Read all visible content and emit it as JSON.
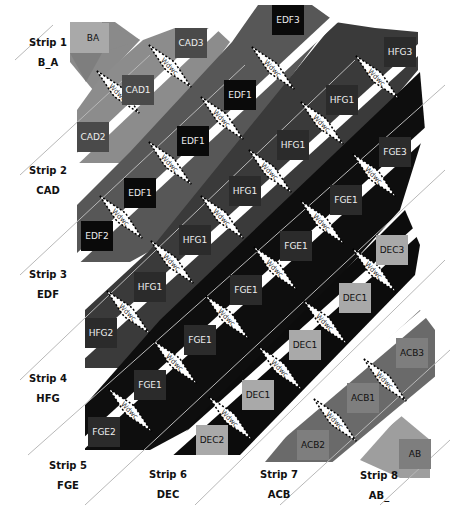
{
  "colors": {
    "background": "#ffffff",
    "light_gray": "#a9a9a9",
    "mid_gray": "#7e7e7e",
    "dark_gray": "#4a4a4a",
    "very_dark": "#2b2b2b",
    "black": "#0a0a0a",
    "separator_line": "#b8b8b8",
    "text_light": "#eeeeee",
    "text_dark": "#111111"
  },
  "strips": [
    {
      "title": "Strip 1",
      "code": "B_A",
      "x": 18,
      "y": 36
    },
    {
      "title": "Strip 2",
      "code": "CAD",
      "x": 18,
      "y": 164
    },
    {
      "title": "Strip 3",
      "code": "EDF",
      "x": 18,
      "y": 268
    },
    {
      "title": "Strip 4",
      "code": "HFG",
      "x": 18,
      "y": 372
    },
    {
      "title": "Strip 5",
      "code": "FGE",
      "x": 38,
      "y": 459
    },
    {
      "title": "Strip 6",
      "code": "DEC",
      "x": 138,
      "y": 468
    },
    {
      "title": "Strip 7",
      "code": "ACB",
      "x": 249,
      "y": 468
    },
    {
      "title": "Strip 8",
      "code": "AB_",
      "x": 349,
      "y": 469
    }
  ],
  "tiles": [
    {
      "label": "BA",
      "x": 93,
      "y": 38,
      "shade": "light",
      "text": "dark"
    },
    {
      "label": "CAD3",
      "x": 191,
      "y": 43,
      "shade": "dark",
      "text": "light"
    },
    {
      "label": "EDF3",
      "x": 288,
      "y": 20,
      "shade": "black",
      "text": "light"
    },
    {
      "label": "HFG3",
      "x": 400,
      "y": 52,
      "shade": "very_dark",
      "text": "light"
    },
    {
      "label": "CAD1",
      "x": 138,
      "y": 90,
      "shade": "dark",
      "text": "light"
    },
    {
      "label": "EDF1",
      "x": 240,
      "y": 95,
      "shade": "black",
      "text": "light"
    },
    {
      "label": "HFG1",
      "x": 342,
      "y": 100,
      "shade": "very_dark",
      "text": "light"
    },
    {
      "label": "CAD2",
      "x": 93,
      "y": 137,
      "shade": "dark",
      "text": "light"
    },
    {
      "label": "EDF1",
      "x": 193,
      "y": 141,
      "shade": "black",
      "text": "light"
    },
    {
      "label": "HFG1",
      "x": 293,
      "y": 145,
      "shade": "very_dark",
      "text": "light"
    },
    {
      "label": "FGE3",
      "x": 395,
      "y": 152,
      "shade": "very_dark",
      "text": "light"
    },
    {
      "label": "EDF1",
      "x": 140,
      "y": 193,
      "shade": "black",
      "text": "light"
    },
    {
      "label": "HFG1",
      "x": 245,
      "y": 191,
      "shade": "very_dark",
      "text": "light"
    },
    {
      "label": "FGE1",
      "x": 346,
      "y": 200,
      "shade": "very_dark",
      "text": "light"
    },
    {
      "label": "DEC3",
      "x": 392,
      "y": 250,
      "shade": "light",
      "text": "dark"
    },
    {
      "label": "EDF2",
      "x": 97,
      "y": 236,
      "shade": "black",
      "text": "light"
    },
    {
      "label": "HFG1",
      "x": 195,
      "y": 240,
      "shade": "very_dark",
      "text": "light"
    },
    {
      "label": "FGE1",
      "x": 296,
      "y": 246,
      "shade": "very_dark",
      "text": "light"
    },
    {
      "label": "DEC1",
      "x": 355,
      "y": 298,
      "shade": "light",
      "text": "dark"
    },
    {
      "label": "HFG1",
      "x": 150,
      "y": 287,
      "shade": "very_dark",
      "text": "light"
    },
    {
      "label": "FGE1",
      "x": 246,
      "y": 290,
      "shade": "very_dark",
      "text": "light"
    },
    {
      "label": "DEC1",
      "x": 305,
      "y": 345,
      "shade": "light",
      "text": "dark"
    },
    {
      "label": "ACB3",
      "x": 412,
      "y": 353,
      "shade": "mid",
      "text": "dark"
    },
    {
      "label": "HFG2",
      "x": 101,
      "y": 333,
      "shade": "very_dark",
      "text": "light"
    },
    {
      "label": "FGE1",
      "x": 200,
      "y": 340,
      "shade": "very_dark",
      "text": "light"
    },
    {
      "label": "DEC1",
      "x": 258,
      "y": 395,
      "shade": "light",
      "text": "dark"
    },
    {
      "label": "ACB1",
      "x": 363,
      "y": 398,
      "shade": "mid",
      "text": "dark"
    },
    {
      "label": "FGE1",
      "x": 150,
      "y": 385,
      "shade": "very_dark",
      "text": "light"
    },
    {
      "label": "FGE2",
      "x": 104,
      "y": 432,
      "shade": "very_dark",
      "text": "light"
    },
    {
      "label": "DEC2",
      "x": 212,
      "y": 440,
      "shade": "light",
      "text": "dark"
    },
    {
      "label": "ACB2",
      "x": 313,
      "y": 445,
      "shade": "mid",
      "text": "dark"
    },
    {
      "label": "AB",
      "x": 415,
      "y": 454,
      "shade": "mid",
      "text": "dark"
    }
  ],
  "zigzag_text": "Wdwc",
  "zigzags": [
    {
      "x": 118,
      "y": 92
    },
    {
      "x": 170,
      "y": 66
    },
    {
      "x": 222,
      "y": 118
    },
    {
      "x": 273,
      "y": 68
    },
    {
      "x": 377,
      "y": 77
    },
    {
      "x": 170,
      "y": 163
    },
    {
      "x": 121,
      "y": 217
    },
    {
      "x": 270,
      "y": 171
    },
    {
      "x": 322,
      "y": 123
    },
    {
      "x": 222,
      "y": 217
    },
    {
      "x": 374,
      "y": 175
    },
    {
      "x": 172,
      "y": 262
    },
    {
      "x": 322,
      "y": 222
    },
    {
      "x": 275,
      "y": 268
    },
    {
      "x": 128,
      "y": 312
    },
    {
      "x": 374,
      "y": 270
    },
    {
      "x": 227,
      "y": 317
    },
    {
      "x": 175,
      "y": 362
    },
    {
      "x": 325,
      "y": 322
    },
    {
      "x": 280,
      "y": 368
    },
    {
      "x": 130,
      "y": 410
    },
    {
      "x": 230,
      "y": 418
    },
    {
      "x": 385,
      "y": 380
    },
    {
      "x": 335,
      "y": 420
    }
  ]
}
